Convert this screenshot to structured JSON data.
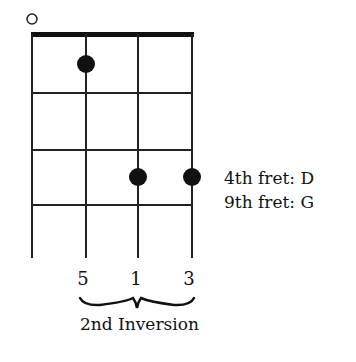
{
  "diagram": {
    "type": "ukulele-chord-diagram",
    "strings": 4,
    "frets_shown": 4,
    "open_strings": [
      1
    ],
    "dots": [
      {
        "string": 2,
        "fret": 1
      },
      {
        "string": 3,
        "fret": 3
      },
      {
        "string": 4,
        "fret": 3
      }
    ],
    "annotations": {
      "line1": "4th fret: D",
      "line2": "9th fret: G"
    },
    "intervals": [
      "5",
      "1",
      "3"
    ],
    "inversion_label": "2nd Inversion"
  }
}
